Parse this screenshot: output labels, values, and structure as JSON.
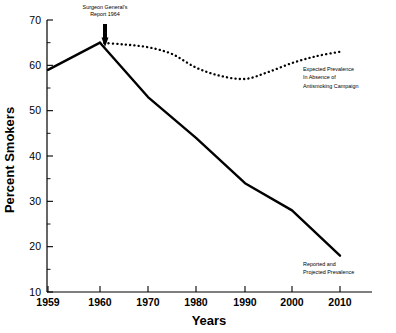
{
  "chart_data": {
    "type": "line",
    "title": "",
    "xlabel": "Years",
    "ylabel": "Percent Smokers",
    "xlim": [
      1959,
      2010
    ],
    "ylim": [
      10,
      70
    ],
    "grid": false,
    "legend_position": "inline-annotations",
    "x_tick_labels": [
      "1959",
      "1960",
      "1970",
      "1980",
      "1990",
      "2000",
      "2010"
    ],
    "x_tick_values": [
      1959,
      1960,
      1970,
      1980,
      1990,
      2000,
      2010
    ],
    "y_tick_labels": [
      "10",
      "20",
      "30",
      "40",
      "50",
      "60",
      "70"
    ],
    "y_tick_values": [
      10,
      20,
      30,
      40,
      50,
      60,
      70
    ],
    "y_minor_tick_values": [
      15,
      25,
      35,
      45,
      55,
      65
    ],
    "series": [
      {
        "name": "Reported and Projected Prevalence",
        "style": "solid",
        "x": [
          1959,
          1960,
          1970,
          1980,
          1990,
          2000,
          2010
        ],
        "values": [
          59,
          65,
          53,
          44,
          34,
          28,
          18
        ]
      },
      {
        "name": "Expected Prevalence In Absence of Antismoking Campaign",
        "style": "dotted",
        "x": [
          1960,
          1965,
          1970,
          1975,
          1980,
          1985,
          1990,
          1995,
          2000,
          2005,
          2010
        ],
        "values": [
          65,
          64.6,
          64,
          62.5,
          59.5,
          57.7,
          57,
          58.5,
          60.5,
          62,
          63
        ]
      }
    ],
    "annotations": [
      {
        "name": "surgeon-general-annotation",
        "lines": [
          "Surgeon General's",
          "Report 1964"
        ],
        "arrow": true,
        "x": 1961,
        "y": 65
      },
      {
        "name": "expected-prevalence-annotation",
        "lines": [
          "Expected Prevalence",
          "In Absence of",
          "Antismoking Campaign"
        ]
      },
      {
        "name": "reported-prevalence-annotation",
        "lines": [
          "Reported and",
          "Projected Prevalence"
        ]
      }
    ],
    "colors": {
      "line": "#000000",
      "axis": "#000000",
      "background": "#ffffff"
    }
  }
}
